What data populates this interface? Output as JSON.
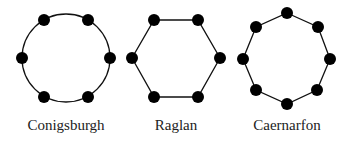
{
  "diagrams": [
    {
      "name": "Conigsburgh",
      "shape": "circle",
      "center": [
        66,
        58
      ],
      "radius": 44,
      "vertices": [
        [
          44,
          20
        ],
        [
          88,
          20
        ],
        [
          110,
          58
        ],
        [
          88,
          97
        ],
        [
          44,
          97
        ],
        [
          22,
          58
        ]
      ],
      "label_pos": [
        66,
        126
      ]
    },
    {
      "name": "Raglan",
      "shape": "hexagon",
      "vertices": [
        [
          154,
          20
        ],
        [
          198,
          20
        ],
        [
          220,
          58
        ],
        [
          198,
          97
        ],
        [
          154,
          97
        ],
        [
          132,
          58
        ]
      ],
      "label_pos": [
        176,
        126
      ]
    },
    {
      "name": "Caernarfon",
      "shape": "octagon",
      "vertices": [
        [
          287,
          13
        ],
        [
          318,
          27
        ],
        [
          330,
          59
        ],
        [
          317,
          90
        ],
        [
          287,
          104
        ],
        [
          256,
          90
        ],
        [
          243,
          59
        ],
        [
          256,
          27
        ]
      ],
      "label_pos": [
        287,
        126
      ]
    }
  ],
  "style": {
    "line_color": "#111111",
    "dot_color": "#000000",
    "dot_radius": 6
  }
}
